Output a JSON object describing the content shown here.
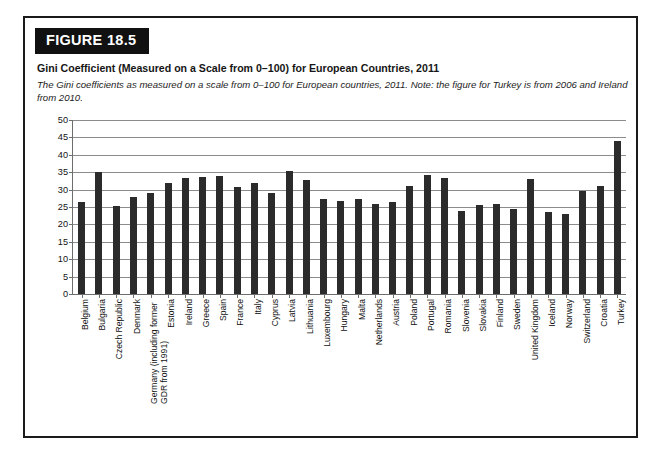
{
  "figure": {
    "badge": "FIGURE 18.5",
    "title": "Gini Coefficient (Measured on a Scale from 0–100) for European Countries, 2011",
    "caption": "The Gini coefficients as measured on a scale from 0–100 for European countries, 2011. Note: the figure for Turkey is from 2006 and Ireland from 2010."
  },
  "chart_data": {
    "type": "bar",
    "title": "Gini Coefficient (Measured on a Scale from 0–100) for European Countries, 2011",
    "xlabel": "",
    "ylabel": "",
    "ylim": [
      0,
      50
    ],
    "ytick_labels": [
      "50",
      "45",
      "40",
      "35",
      "30",
      "25",
      "20",
      "15",
      "10",
      "5",
      "0"
    ],
    "yticks": [
      50,
      45,
      40,
      35,
      30,
      25,
      20,
      15,
      10,
      5,
      0
    ],
    "grid": true,
    "legend": "none",
    "bar_color": "#2b2b2b",
    "categories": [
      "Belgium",
      "Bulgaria",
      "Czech Republic",
      "Denmark",
      "Germany (including former GDR from 1991)",
      "Estonia",
      "Ireland",
      "Greece",
      "Spain",
      "France",
      "Italy",
      "Cyprus",
      "Latvia",
      "Lithuania",
      "Luxembourg",
      "Hungary",
      "Malta",
      "Netherlands",
      "Austria",
      "Poland",
      "Portugal",
      "Romania",
      "Slovenia",
      "Slovakia",
      "Finland",
      "Sweden",
      "United Kingdom",
      "Iceland",
      "Norway",
      "Switzerland",
      "Croatia",
      "Turkey"
    ],
    "values": [
      26.3,
      35.0,
      25.2,
      27.8,
      29.0,
      31.9,
      33.2,
      33.6,
      34.0,
      30.8,
      31.9,
      29.1,
      35.4,
      32.9,
      27.2,
      26.8,
      27.4,
      25.8,
      26.3,
      31.1,
      34.2,
      33.2,
      23.8,
      25.7,
      25.8,
      24.4,
      33.0,
      23.6,
      22.9,
      29.7,
      30.9,
      43.9
    ]
  }
}
